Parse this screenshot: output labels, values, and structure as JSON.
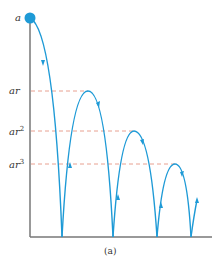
{
  "diagram": {
    "caption": "(a)",
    "start_label": "a",
    "levels": [
      {
        "base": "ar",
        "exp": "",
        "y": 91
      },
      {
        "base": "ar",
        "exp": "2",
        "y": 131
      },
      {
        "base": "ar",
        "exp": "3",
        "y": 164
      }
    ],
    "colors": {
      "curve": "#1e9ad6",
      "ball": "#1e9ad6",
      "axis": "#777777",
      "dash": "#e8a090",
      "text": "#333333"
    },
    "bounces": [
      {
        "from_x": 30,
        "from_y": 18,
        "to_x": 62,
        "peak_y": 18
      },
      {
        "from_x": 62,
        "to_x": 113,
        "peak_x": 88,
        "peak_y": 91
      },
      {
        "from_x": 113,
        "to_x": 157,
        "peak_x": 134,
        "peak_y": 131
      },
      {
        "from_x": 157,
        "to_x": 191,
        "peak_x": 175,
        "peak_y": 164
      }
    ]
  }
}
